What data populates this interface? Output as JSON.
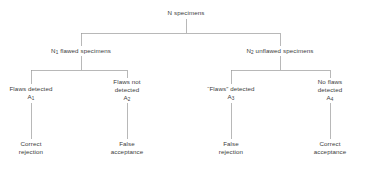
{
  "diagram": {
    "type": "decision-tree",
    "line_color": "#9a9a9a",
    "text_color": "#3b3b3b",
    "background_color": "#ffffff",
    "root": {
      "label": "N specimens"
    },
    "level2": [
      {
        "prefix": "N",
        "subscript": "1",
        "label": " flawed specimens"
      },
      {
        "prefix": "N",
        "subscript": "2",
        "label": " unflawed specimens"
      }
    ],
    "level3": [
      {
        "line1": "Flaws detected",
        "line2": "",
        "code_prefix": "A",
        "code_subscript": "1"
      },
      {
        "line1": "Flaws not",
        "line2": "detected",
        "code_prefix": "A",
        "code_subscript": "2"
      },
      {
        "line1": "“Flaws” detected",
        "line2": "",
        "code_prefix": "A",
        "code_subscript": "3"
      },
      {
        "line1": "No flaws",
        "line2": "detected",
        "code_prefix": "A",
        "code_subscript": "4"
      }
    ],
    "outcomes": [
      {
        "line1": "Correct",
        "line2": "rejection"
      },
      {
        "line1": "False",
        "line2": "acceptance"
      },
      {
        "line1": "False",
        "line2": "rejection"
      },
      {
        "line1": "Correct",
        "line2": "acceptance"
      }
    ]
  }
}
